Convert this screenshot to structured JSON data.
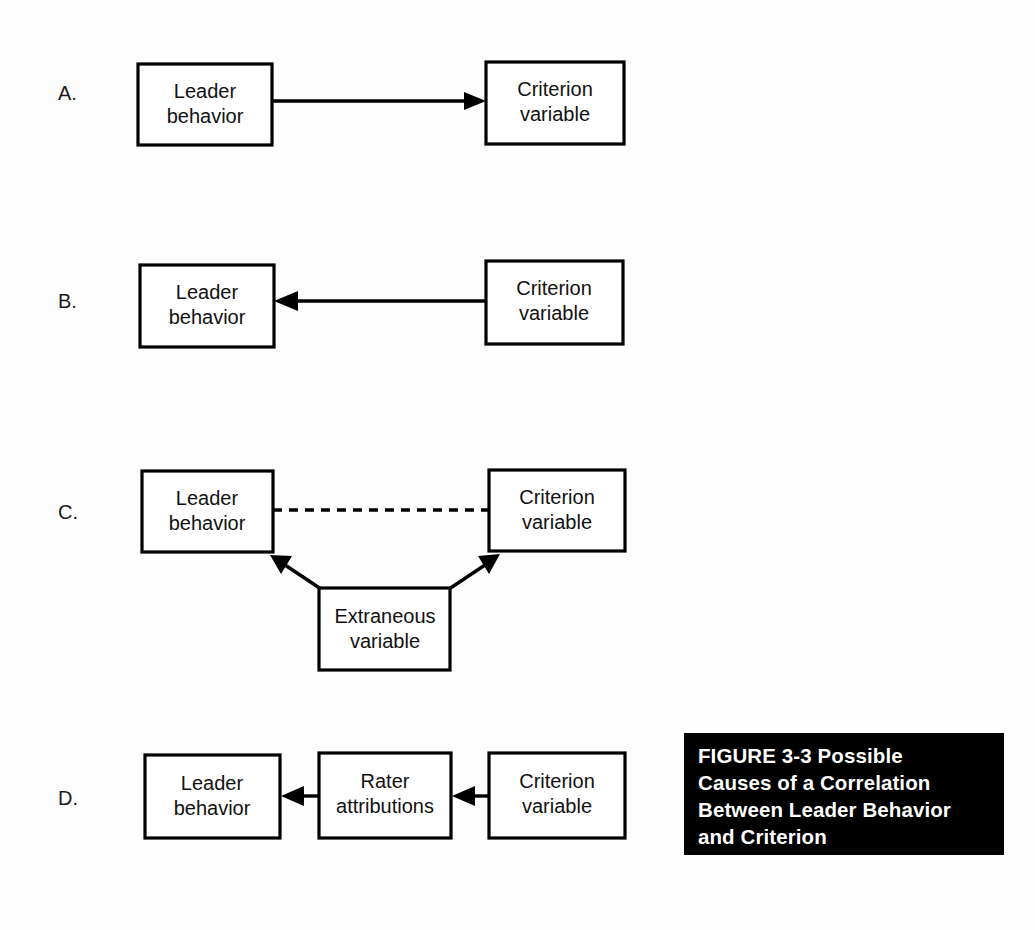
{
  "figure": {
    "caption": "FIGURE 3-3   Possible\nCauses of a Correlation\nBetween Leader Behavior\nand Criterion",
    "caption_background": "#000000",
    "caption_color": "#ffffff",
    "page_background": "#fdfdfd",
    "stroke_color": "#000000"
  },
  "panels": [
    {
      "label": "A.",
      "nodes": [
        {
          "id": "a-leader",
          "text_line1": "Leader",
          "text_line2": "behavior"
        },
        {
          "id": "a-criterion",
          "text_line1": "Criterion",
          "text_line2": "variable"
        }
      ],
      "links": [
        {
          "from": "a-leader",
          "to": "a-criterion",
          "style": "solid",
          "arrow": "forward"
        }
      ]
    },
    {
      "label": "B.",
      "nodes": [
        {
          "id": "b-leader",
          "text_line1": "Leader",
          "text_line2": "behavior"
        },
        {
          "id": "b-criterion",
          "text_line1": "Criterion",
          "text_line2": "variable"
        }
      ],
      "links": [
        {
          "from": "b-criterion",
          "to": "b-leader",
          "style": "solid",
          "arrow": "forward"
        }
      ]
    },
    {
      "label": "C.",
      "nodes": [
        {
          "id": "c-leader",
          "text_line1": "Leader",
          "text_line2": "behavior"
        },
        {
          "id": "c-criterion",
          "text_line1": "Criterion",
          "text_line2": "variable"
        },
        {
          "id": "c-extraneous",
          "text_line1": "Extraneous",
          "text_line2": "variable"
        }
      ],
      "links": [
        {
          "from": "c-leader",
          "to": "c-criterion",
          "style": "dashed",
          "arrow": "none"
        },
        {
          "from": "c-extraneous",
          "to": "c-leader",
          "style": "solid",
          "arrow": "forward"
        },
        {
          "from": "c-extraneous",
          "to": "c-criterion",
          "style": "solid",
          "arrow": "forward"
        }
      ]
    },
    {
      "label": "D.",
      "nodes": [
        {
          "id": "d-leader",
          "text_line1": "Leader",
          "text_line2": "behavior"
        },
        {
          "id": "d-rater",
          "text_line1": "Rater",
          "text_line2": "attributions"
        },
        {
          "id": "d-criterion",
          "text_line1": "Criterion",
          "text_line2": "variable"
        }
      ],
      "links": [
        {
          "from": "d-rater",
          "to": "d-leader",
          "style": "solid",
          "arrow": "forward"
        },
        {
          "from": "d-criterion",
          "to": "d-rater",
          "style": "solid",
          "arrow": "forward"
        }
      ]
    }
  ]
}
